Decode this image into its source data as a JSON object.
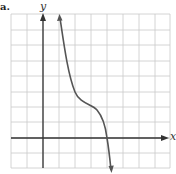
{
  "figure": {
    "part_label": "a.",
    "axis_labels": {
      "x": "x",
      "y": "y"
    },
    "grid": {
      "x_lines": [
        11,
        27,
        43,
        59,
        75,
        91,
        107,
        123,
        139,
        155,
        170
      ],
      "y_lines": [
        14,
        30,
        45,
        61,
        76,
        92,
        107,
        122,
        138,
        153,
        168
      ],
      "left": 11,
      "right": 170,
      "top": 14,
      "bottom": 168,
      "color": "#c9c9c9"
    },
    "axes": {
      "y_axis_x": 43,
      "x_axis_y": 138,
      "color": "#333333"
    },
    "curve": {
      "description": "Decreasing cubic-like curve with horizontal inflection plateau, arrows at both ends",
      "color": "#555555",
      "path": "M 60 18 C 64 45, 68 75, 75 92 C 80 104, 92 104, 97 110 C 103 117, 106 130, 107 138 C 109 150, 110 160, 111 170"
    }
  },
  "chart_data": {
    "type": "line",
    "title": "",
    "xlabel": "x",
    "ylabel": "y",
    "grid": true,
    "x_grid_units": "1 square per unit; y-axis at column 3 from left",
    "points_in_grid_units": [
      {
        "x": 1.1,
        "y": 7.7
      },
      {
        "x": 2.0,
        "y": 3.0
      },
      {
        "x": 3.0,
        "y": 2.0
      },
      {
        "x": 3.5,
        "y": 1.8
      },
      {
        "x": 4.0,
        "y": 0.0
      },
      {
        "x": 4.3,
        "y": -2.0
      }
    ]
  }
}
